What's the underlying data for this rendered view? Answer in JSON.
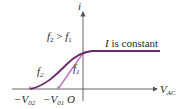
{
  "diagram": {
    "axes": {
      "y_label": "i",
      "x_label_main": "V",
      "x_label_sub": "AC",
      "origin_label": "O"
    },
    "annotations": {
      "relation_main_f2": "f",
      "relation_sub_2": "2",
      "relation_op": " > ",
      "relation_main_f1": "f",
      "relation_sub_1": "1",
      "plateau_text_I": "I",
      "plateau_text_rest": " is constant"
    },
    "curves": [
      {
        "name": "f2",
        "label_main": "f",
        "label_sub": "2",
        "color": "#6b2a6e",
        "stopping_voltage_label_main": "−V",
        "stopping_voltage_label_sub": "02"
      },
      {
        "name": "f1",
        "label_main": "f",
        "label_sub": "1",
        "color": "#c07ac4",
        "stopping_voltage_label_main": "−V",
        "stopping_voltage_label_sub": "01"
      }
    ],
    "colors": {
      "axis": "#555555",
      "f2_curve": "#6b2a6e",
      "f1_curve": "#c07ac4"
    }
  }
}
